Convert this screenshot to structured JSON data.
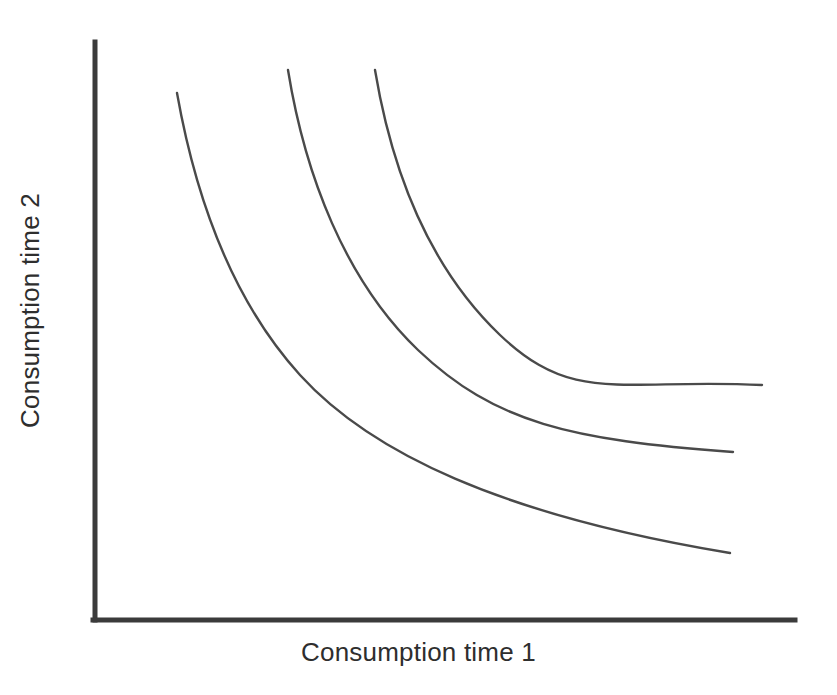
{
  "chart_data": {
    "type": "line",
    "title": "",
    "subtitle": "",
    "xlabel": "Consumption time 1",
    "ylabel": "Consumption time 2",
    "grid": false,
    "legend": "none",
    "annotations": [],
    "tick_labels": {
      "x": [],
      "y": []
    },
    "xlim": [
      0,
      100
    ],
    "ylim": [
      0,
      100
    ],
    "series": [
      {
        "name": "Indifference curve 1 (lowest utility)",
        "x": [
          11.7,
          15.0,
          20.0,
          26.0,
          32.2,
          40.0,
          47.2,
          55.0,
          62.2,
          70.0,
          78.0,
          86.0,
          90.6
        ],
        "y": [
          91.0,
          85.0,
          76.3,
          66.0,
          58.0,
          48.3,
          41.6,
          35.6,
          31.0,
          26.8,
          23.3,
          21.0,
          20.2
        ]
      },
      {
        "name": "Indifference curve 2 (middle utility)",
        "x": [
          27.5,
          31.0,
          36.0,
          42.0,
          48.7,
          55.0,
          62.2,
          70.0,
          78.0,
          86.0,
          91.0
        ],
        "y": [
          95.0,
          88.0,
          79.0,
          69.4,
          60.5,
          54.0,
          47.6,
          42.4,
          38.3,
          35.3,
          34.2
        ]
      },
      {
        "name": "Indifference curve 3 (highest utility)",
        "x": [
          39.6,
          43.0,
          48.0,
          54.0,
          60.5,
          67.0,
          73.5,
          80.0,
          87.0,
          93.0,
          95.1
        ],
        "y": [
          95.0,
          88.5,
          80.0,
          71.6,
          64.0,
          58.0,
          53.2,
          49.0,
          45.6,
          43.3,
          42.7
        ]
      }
    ]
  },
  "axes": {
    "y_axis_name": "vertical-axis-line",
    "x_axis_name": "horizontal-axis-line",
    "color": "#3b3b3b"
  },
  "curves": {
    "color": "#4a4a4a",
    "curve1_path": "M 177 93 C 196 200, 232 300, 300 375 C 370 452, 500 515, 730 553",
    "curve2_path": "M 288 70 C 305 175, 345 280, 418 350 C 495 423, 570 440, 733 452",
    "curve3_path": "M 375 70 C 392 172, 430 268, 500 335 C 575 406, 620 378, 762 385"
  }
}
